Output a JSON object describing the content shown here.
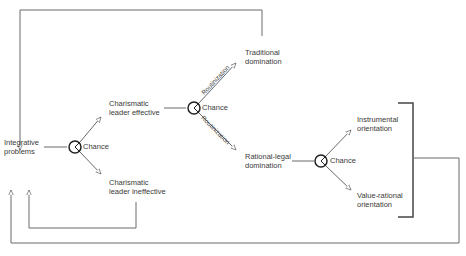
{
  "nodes": {
    "integrative": {
      "line1": "Integrative",
      "line2": "problems"
    },
    "chance1": "Chance",
    "effective": {
      "line1": "Charismatic",
      "line2": "leader effective"
    },
    "ineffective": {
      "line1": "Charismatic",
      "line2": "leader ineffective"
    },
    "chance2": "Chance",
    "traditional": {
      "line1": "Traditional",
      "line2": "domination"
    },
    "rational_legal": {
      "line1": "Rational-legal",
      "line2": "domination"
    },
    "chance3": "Chance",
    "instrumental": {
      "line1": "Instrumental",
      "line2": "orientation"
    },
    "value_rational": {
      "line1": "Value-rational",
      "line2": "orientation"
    }
  },
  "edges": {
    "routinization_up": "Routinization",
    "routinization_down": "Routinization"
  },
  "colors": {
    "line": "#6a6a6a",
    "text": "#3a3a3a"
  }
}
